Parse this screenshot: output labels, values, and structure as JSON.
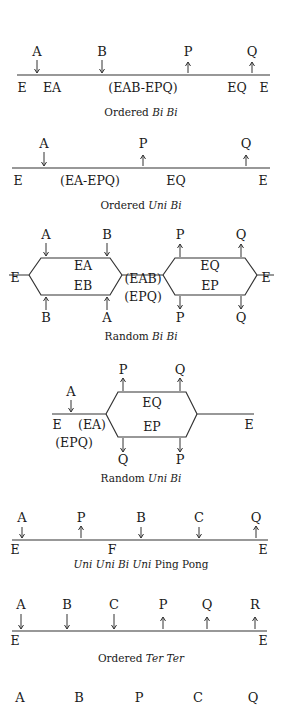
{
  "colors": {
    "ink": "#1a1a1a",
    "line": "#333333",
    "background": "#ffffff"
  },
  "diagrams": [
    {
      "id": "ordered-bi-bi",
      "caption": {
        "prefix": "Ordered ",
        "italic": "Bi Bi",
        "suffix": ""
      },
      "line": {
        "x1": 17,
        "x2": 270,
        "y": 75
      },
      "substrates": [
        {
          "label": "A",
          "x": 37,
          "dir": "down"
        },
        {
          "label": "B",
          "x": 102,
          "dir": "down"
        }
      ],
      "products": [
        {
          "label": "P",
          "x": 188,
          "dir": "up"
        },
        {
          "label": "Q",
          "x": 252,
          "dir": "up"
        }
      ],
      "species": [
        {
          "label": "E",
          "x": 22
        },
        {
          "label": "EA",
          "x": 52
        },
        {
          "label": "(EAB-EPQ)",
          "x": 143
        },
        {
          "label": "EQ",
          "x": 237
        },
        {
          "label": "E",
          "x": 264
        }
      ],
      "label_y": 56,
      "species_y": 92,
      "caption_y": 116
    },
    {
      "id": "ordered-uni-bi",
      "caption": {
        "prefix": "Ordered ",
        "italic": "Uni Bi",
        "suffix": ""
      },
      "line": {
        "x1": 12,
        "x2": 270,
        "y": 168
      },
      "substrates": [
        {
          "label": "A",
          "x": 44,
          "dir": "down"
        }
      ],
      "products": [
        {
          "label": "P",
          "x": 143,
          "dir": "up"
        },
        {
          "label": "Q",
          "x": 246,
          "dir": "up"
        }
      ],
      "species": [
        {
          "label": "E",
          "x": 18
        },
        {
          "label": "(EA-EPQ)",
          "x": 90
        },
        {
          "label": "EQ",
          "x": 176
        },
        {
          "label": "E",
          "x": 263
        }
      ],
      "label_y": 148,
      "species_y": 185,
      "caption_y": 209
    }
  ],
  "random_bi_bi": {
    "caption": {
      "prefix": "Random ",
      "italic": "Bi Bi",
      "suffix": ""
    },
    "outer_species": [
      {
        "label": "E",
        "x": 15,
        "y": 282
      },
      {
        "label": "E",
        "x": 266,
        "y": 282
      }
    ],
    "center_species": [
      {
        "label": "(EAB)",
        "x": 143,
        "y": 283
      },
      {
        "label": "(EPQ)",
        "x": 143,
        "y": 301
      }
    ],
    "left_loop": {
      "upper": "EA",
      "lower": "EB"
    },
    "right_loop": {
      "upper": "EQ",
      "lower": "EP"
    },
    "top_labels": [
      {
        "label": "A",
        "x": 46,
        "dir": "down"
      },
      {
        "label": "B",
        "x": 107,
        "dir": "down"
      },
      {
        "label": "P",
        "x": 180,
        "dir": "up"
      },
      {
        "label": "Q",
        "x": 241,
        "dir": "up"
      }
    ],
    "bottom_labels": [
      {
        "label": "B",
        "x": 46,
        "dir": "up"
      },
      {
        "label": "A",
        "x": 107,
        "dir": "up"
      },
      {
        "label": "P",
        "x": 180,
        "dir": "down"
      },
      {
        "label": "Q",
        "x": 241,
        "dir": "down"
      }
    ],
    "caption_y": 340
  },
  "random_uni_bi": {
    "caption": {
      "prefix": "Random ",
      "italic": "Uni Bi",
      "suffix": ""
    },
    "substrate": {
      "label": "A",
      "x": 71,
      "dir": "down"
    },
    "species": [
      {
        "label": "E",
        "x": 57,
        "y": 429
      },
      {
        "label": "(EA)",
        "x": 92,
        "y": 429
      },
      {
        "label": "(EPQ)",
        "x": 74,
        "y": 447
      },
      {
        "label": "E",
        "x": 249,
        "y": 429
      }
    ],
    "loop": {
      "upper": "EQ",
      "lower": "EP"
    },
    "top_labels": [
      {
        "label": "P",
        "x": 123,
        "dir": "up"
      },
      {
        "label": "Q",
        "x": 180,
        "dir": "up"
      }
    ],
    "bottom_labels": [
      {
        "label": "Q",
        "x": 123,
        "dir": "down"
      },
      {
        "label": "P",
        "x": 180,
        "dir": "down"
      }
    ],
    "caption_y": 482
  },
  "ping_pong": {
    "caption": {
      "prefix": "",
      "italic": "Uni Uni Bi Uni",
      "suffix": " Ping Pong"
    },
    "line": {
      "x1": 12,
      "x2": 268,
      "y": 540
    },
    "reactants": [
      {
        "label": "A",
        "x": 22,
        "dir": "down"
      },
      {
        "label": "P",
        "x": 81,
        "dir": "up"
      },
      {
        "label": "B",
        "x": 141,
        "dir": "down"
      },
      {
        "label": "C",
        "x": 199,
        "dir": "down"
      },
      {
        "label": "Q",
        "x": 256,
        "dir": "up"
      }
    ],
    "species": [
      {
        "label": "E",
        "x": 15
      },
      {
        "label": "F",
        "x": 112
      },
      {
        "label": "E",
        "x": 263
      }
    ],
    "label_y": 522,
    "species_y": 554,
    "caption_y": 568
  },
  "ordered_ter_ter": {
    "caption": {
      "prefix": "Ordered ",
      "italic": "Ter Ter",
      "suffix": ""
    },
    "line": {
      "x1": 12,
      "x2": 267,
      "y": 631
    },
    "reactants": [
      {
        "label": "A",
        "x": 21,
        "dir": "down"
      },
      {
        "label": "B",
        "x": 67,
        "dir": "down"
      },
      {
        "label": "C",
        "x": 114,
        "dir": "down"
      },
      {
        "label": "P",
        "x": 163,
        "dir": "up"
      },
      {
        "label": "Q",
        "x": 207,
        "dir": "up"
      },
      {
        "label": "R",
        "x": 255,
        "dir": "up"
      }
    ],
    "species": [
      {
        "label": "E",
        "x": 15
      },
      {
        "label": "E",
        "x": 263
      }
    ],
    "label_y": 609,
    "species_y": 645,
    "caption_y": 662
  },
  "partial_row": {
    "labels": [
      {
        "label": "A",
        "x": 20
      },
      {
        "label": "B",
        "x": 79
      },
      {
        "label": "P",
        "x": 139
      },
      {
        "label": "C",
        "x": 198
      },
      {
        "label": "Q",
        "x": 253
      }
    ],
    "y": 702
  }
}
